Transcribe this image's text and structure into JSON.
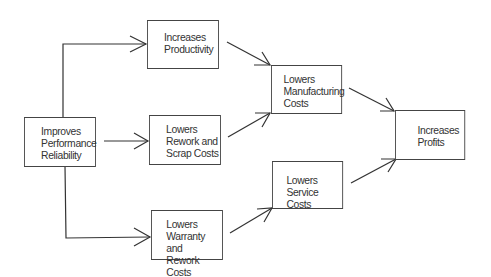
{
  "diagram": {
    "type": "flowchart",
    "nodes": [
      {
        "id": "improves_reliability",
        "lines": [
          "Improves",
          "Performance",
          "Reliability"
        ]
      },
      {
        "id": "increases_productivity",
        "lines": [
          "Increases",
          "Productivity"
        ]
      },
      {
        "id": "lowers_rework_scrap",
        "lines": [
          "Lowers",
          "Rework and",
          "Scrap Costs"
        ]
      },
      {
        "id": "lowers_warranty_rework",
        "lines": [
          "Lowers",
          "Warranty and",
          "Rework Costs"
        ]
      },
      {
        "id": "lowers_manufacturing",
        "lines": [
          "Lowers",
          "Manufacturing",
          "Costs"
        ]
      },
      {
        "id": "lowers_service",
        "lines": [
          "Lowers",
          "Service Costs"
        ]
      },
      {
        "id": "increases_profits",
        "lines": [
          "Increases",
          "Profits"
        ]
      }
    ],
    "edges": [
      {
        "from": "improves_reliability",
        "to": "increases_productivity"
      },
      {
        "from": "improves_reliability",
        "to": "lowers_rework_scrap"
      },
      {
        "from": "improves_reliability",
        "to": "lowers_warranty_rework"
      },
      {
        "from": "increases_productivity",
        "to": "lowers_manufacturing"
      },
      {
        "from": "lowers_rework_scrap",
        "to": "lowers_manufacturing"
      },
      {
        "from": "lowers_warranty_rework",
        "to": "lowers_service"
      },
      {
        "from": "lowers_manufacturing",
        "to": "increases_profits"
      },
      {
        "from": "lowers_service",
        "to": "increases_profits"
      }
    ]
  }
}
